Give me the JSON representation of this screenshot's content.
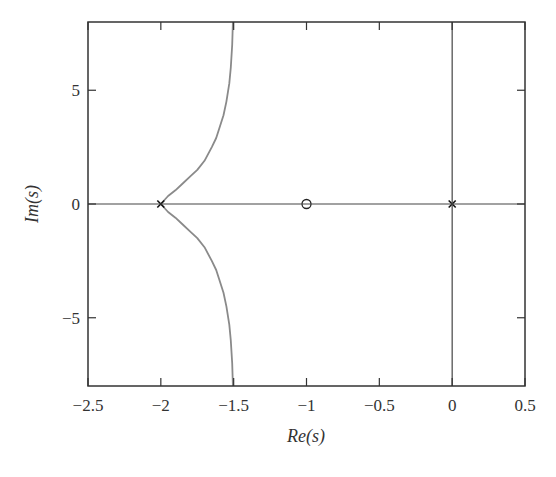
{
  "chart_data": {
    "type": "line",
    "title": "",
    "subtitle": "",
    "xlabel": "Re(s)",
    "ylabel": "Im(s)",
    "xlim": [
      -2.5,
      0.5
    ],
    "ylim": [
      -8,
      8
    ],
    "xticks": [
      -2.5,
      -2,
      -1.5,
      -1,
      -0.5,
      0,
      0.5
    ],
    "xtick_labels": [
      "−2.5",
      "−2",
      "−1.5",
      "−1",
      "−0.5",
      "0",
      "0.5"
    ],
    "yticks": [
      -5,
      0,
      5
    ],
    "ytick_labels": [
      "−5",
      "0",
      "5"
    ],
    "grid": false,
    "legend": null,
    "reference_lines": [
      {
        "orientation": "horizontal",
        "value": 0
      },
      {
        "orientation": "vertical",
        "value": 0
      }
    ],
    "series": [
      {
        "name": "root locus (upper branch)",
        "color": "#8a8a8a",
        "x": [
          -2.0,
          -1.95,
          -1.9,
          -1.85,
          -1.8,
          -1.75,
          -1.7,
          -1.65,
          -1.62,
          -1.6,
          -1.57,
          -1.55,
          -1.53,
          -1.52,
          -1.51,
          -1.505
        ],
        "y": [
          0.0,
          0.35,
          0.6,
          0.9,
          1.2,
          1.5,
          1.9,
          2.5,
          2.9,
          3.3,
          3.9,
          4.5,
          5.3,
          6.0,
          7.0,
          8.0
        ]
      },
      {
        "name": "root locus (lower branch)",
        "color": "#8a8a8a",
        "x": [
          -2.0,
          -1.95,
          -1.9,
          -1.85,
          -1.8,
          -1.75,
          -1.7,
          -1.65,
          -1.62,
          -1.6,
          -1.57,
          -1.55,
          -1.53,
          -1.52,
          -1.51,
          -1.505
        ],
        "y": [
          0.0,
          -0.35,
          -0.6,
          -0.9,
          -1.2,
          -1.5,
          -1.9,
          -2.5,
          -2.9,
          -3.3,
          -3.9,
          -4.5,
          -5.3,
          -6.0,
          -7.0,
          -8.0
        ]
      }
    ],
    "markers": [
      {
        "type": "pole",
        "symbol": "x",
        "x": -2,
        "y": 0
      },
      {
        "type": "pole",
        "symbol": "x",
        "x": 0,
        "y": 0
      },
      {
        "type": "zero",
        "symbol": "o",
        "x": -1,
        "y": 0
      }
    ]
  }
}
